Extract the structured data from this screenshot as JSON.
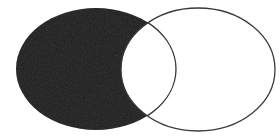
{
  "diagram": {
    "type": "venn",
    "sets": [
      {
        "name": "A",
        "cx": 96,
        "cy": 69,
        "rx": 80,
        "ry": 61,
        "fill": "#1f1f1f",
        "shaded_region": "A only"
      },
      {
        "name": "B",
        "cx": 198,
        "cy": 69.5,
        "rx": 77,
        "ry": 61.5,
        "fill": "none"
      }
    ],
    "intersection_fill": "#ffffff",
    "stroke_color": "#3a3a3a",
    "background": "#ffffff"
  }
}
